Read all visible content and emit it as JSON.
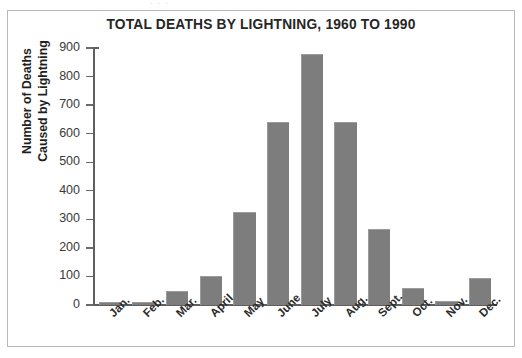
{
  "figure": {
    "frame_visible": true,
    "background_color": "#ffffff",
    "border_color": "#b9b9b9",
    "scan_artifact_text": "· ·                                   ·"
  },
  "chart_data": {
    "type": "bar",
    "title": "TOTAL DEATHS BY LIGHTNING, 1960 TO 1990",
    "xlabel": "",
    "ylabel": "Number of Deaths Caused by Lightning",
    "ylabel_lines": [
      "Number of Deaths",
      "Caused by Lightning"
    ],
    "categories": [
      "Jan.",
      "Feb.",
      "Mar.",
      "April",
      "May",
      "June",
      "July",
      "Aug.",
      "Sept.",
      "Oct.",
      "Nov.",
      "Dec."
    ],
    "values": [
      10,
      10,
      50,
      100,
      325,
      640,
      880,
      640,
      265,
      60,
      15,
      95
    ],
    "ylim": [
      0,
      900
    ],
    "ytick_values": [
      0,
      100,
      200,
      300,
      400,
      500,
      600,
      700,
      800,
      900
    ],
    "ytick_labels": [
      "0",
      "100",
      "200",
      "300",
      "400",
      "500",
      "600",
      "700",
      "800",
      "900"
    ],
    "grid": false,
    "legend": false,
    "bar_color": "#7d7d7d",
    "axis_color": "#5f5f5f",
    "title_color": "#262626",
    "xtick_rotation_degrees": 45
  }
}
